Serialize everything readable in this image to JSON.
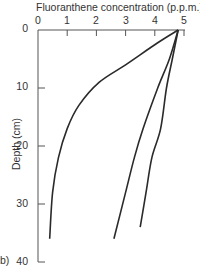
{
  "chart_data": {
    "type": "line",
    "title": "Fluoranthene concentration (p.p.m.)",
    "xlabel": "Fluoranthene concentration (p.p.m.)",
    "ylabel": "Depth (cm)",
    "x_axis_position": "top",
    "y_axis_inverted": true,
    "xlim": [
      0,
      5
    ],
    "ylim": [
      0,
      40
    ],
    "xticks": [
      0,
      1,
      2,
      3,
      4,
      5
    ],
    "yticks": [
      0,
      10,
      20,
      30,
      40
    ],
    "grid": false,
    "panel_label": "b)",
    "series": [
      {
        "name": "profile-1",
        "points": [
          [
            4.8,
            0
          ],
          [
            4.1,
            2.2
          ],
          [
            3.0,
            6
          ],
          [
            2.1,
            9
          ],
          [
            1.4,
            13
          ],
          [
            1.0,
            17
          ],
          [
            0.7,
            22
          ],
          [
            0.5,
            28
          ],
          [
            0.4,
            36
          ]
        ]
      },
      {
        "name": "profile-2",
        "points": [
          [
            4.8,
            0
          ],
          [
            4.5,
            5
          ],
          [
            4.1,
            10
          ],
          [
            3.6,
            17
          ],
          [
            3.3,
            22
          ],
          [
            3.0,
            28
          ],
          [
            2.6,
            36
          ]
        ]
      },
      {
        "name": "profile-3",
        "points": [
          [
            4.8,
            0
          ],
          [
            4.6,
            5
          ],
          [
            4.4,
            10
          ],
          [
            4.2,
            17
          ],
          [
            3.9,
            22
          ],
          [
            3.7,
            28
          ],
          [
            3.5,
            34
          ]
        ]
      }
    ]
  },
  "labels": {
    "title": "Fluoranthene concentration (p.p.m.)",
    "ylabel": "Depth (cm)",
    "panel": "b)",
    "xticks": [
      "0",
      "1",
      "2",
      "3",
      "4",
      "5"
    ],
    "yticks": [
      "0",
      "10",
      "20",
      "30",
      "40"
    ]
  },
  "colors": {
    "line": "#2a2a2a",
    "axis": "#555555",
    "text": "#333333"
  }
}
